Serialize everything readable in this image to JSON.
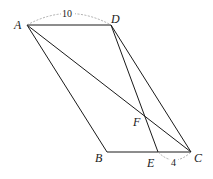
{
  "diagram": {
    "type": "parallelogram-geometry",
    "points": {
      "A": {
        "label": "A",
        "x": 27,
        "y": 25
      },
      "D": {
        "label": "D",
        "x": 111,
        "y": 25
      },
      "B": {
        "label": "B",
        "x": 107,
        "y": 152
      },
      "C": {
        "label": "C",
        "x": 191,
        "y": 152
      },
      "E": {
        "label": "E",
        "x": 158,
        "y": 152
      },
      "F": {
        "label": "F",
        "x": 143,
        "y": 113
      }
    },
    "segments": [
      "AD",
      "AB",
      "BC",
      "DC",
      "AC",
      "DE"
    ],
    "measurements": {
      "AD": "10",
      "EC": "4"
    }
  }
}
